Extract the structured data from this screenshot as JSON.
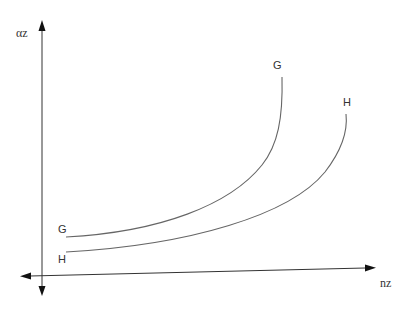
{
  "diagram": {
    "axes": {
      "y_label": "αz",
      "x_label": "nz",
      "y_arrows": "both",
      "x_arrows": "both"
    },
    "curves": [
      {
        "name": "G",
        "label_start": "G",
        "label_end": "G"
      },
      {
        "name": "H",
        "label_start": "H",
        "label_end": "H"
      }
    ],
    "colors": {
      "axis": "#333333",
      "curve": "#666666",
      "text": "#333333"
    }
  }
}
